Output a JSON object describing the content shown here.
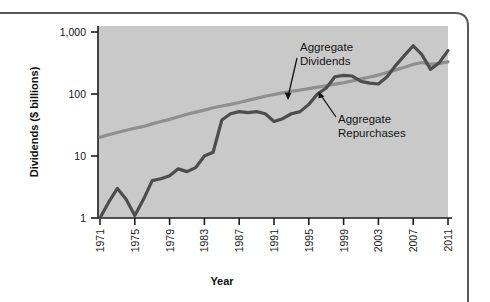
{
  "figure": {
    "frame_color": "#4a4a4a",
    "plot_bg_color": "#c9c9c9",
    "axis_color": "#1c1c1c"
  },
  "chart_data": {
    "type": "line",
    "title": "",
    "subtitle": "",
    "xlabel": "Year",
    "ylabel": "Dividends ($ billions)",
    "yscale": "log",
    "ylim": [
      1,
      1000
    ],
    "xlim": [
      1971,
      2011
    ],
    "grid": false,
    "legend_position": "inline-annotations",
    "ytick_labels": [
      "1",
      "10",
      "100",
      "1,000"
    ],
    "ytick_values": [
      1,
      10,
      100,
      1000
    ],
    "xtick_labels": [
      "1971",
      "1975",
      "1979",
      "1983",
      "1987",
      "1991",
      "1995",
      "1999",
      "2003",
      "2007",
      "2011"
    ],
    "xtick_values": [
      1971,
      1975,
      1979,
      1983,
      1987,
      1991,
      1995,
      1999,
      2003,
      2007,
      2011
    ],
    "x": [
      1971,
      1972,
      1973,
      1974,
      1975,
      1976,
      1977,
      1978,
      1979,
      1980,
      1981,
      1982,
      1983,
      1984,
      1985,
      1986,
      1987,
      1988,
      1989,
      1990,
      1991,
      1992,
      1993,
      1994,
      1995,
      1996,
      1997,
      1998,
      1999,
      2000,
      2001,
      2002,
      2003,
      2004,
      2005,
      2006,
      2007,
      2008,
      2009,
      2010,
      2011
    ],
    "series": [
      {
        "name": "Aggregate Dividends",
        "color": "#8f8f8f",
        "line_width": 3.2,
        "values": [
          20,
          22,
          24,
          26,
          28,
          30,
          33,
          36,
          39,
          43,
          47,
          51,
          55,
          60,
          64,
          68,
          73,
          79,
          85,
          92,
          98,
          104,
          110,
          116,
          122,
          129,
          136,
          144,
          152,
          163,
          175,
          188,
          202,
          222,
          245,
          270,
          300,
          322,
          300,
          312,
          330
        ]
      },
      {
        "name": "Aggregate Repurchases",
        "color": "#4d4d4d",
        "line_width": 3.2,
        "values": [
          1.0,
          1.8,
          3.0,
          2.0,
          1.1,
          2.0,
          4.0,
          4.3,
          4.8,
          6.2,
          5.6,
          6.5,
          10.0,
          11.5,
          38,
          48,
          52,
          50,
          52,
          48,
          36,
          40,
          48,
          52,
          68,
          100,
          125,
          190,
          200,
          195,
          160,
          150,
          145,
          190,
          290,
          420,
          600,
          430,
          250,
          320,
          500
        ]
      }
    ],
    "annotations": [
      {
        "id": "annot-dividends",
        "text_line1": "Aggregate",
        "text_line2": "Dividends"
      },
      {
        "id": "annot-repurchases",
        "text_line1": "Aggregate",
        "text_line2": "Repurchases"
      }
    ]
  }
}
